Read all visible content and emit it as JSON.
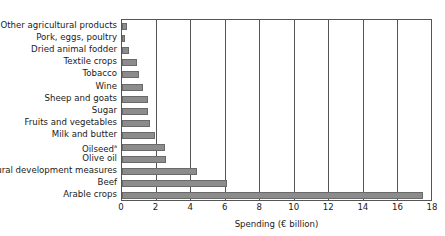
{
  "chart_data": {
    "type": "bar",
    "orientation": "horizontal",
    "title": "",
    "xlabel": "Spending (€ billion)",
    "ylabel": "",
    "xlim": [
      0,
      18
    ],
    "xticks": [
      0,
      2,
      4,
      6,
      8,
      10,
      12,
      14,
      16,
      18
    ],
    "grid": "vertical",
    "legend": null,
    "categories": [
      "Other agricultural products",
      "Pork, eggs, poultry",
      "Dried animal fodder",
      "Textile crops",
      "Tobacco",
      "Wine",
      "Sheep and goats",
      "Sugar",
      "Fruits and vegetables",
      "Milk and butter",
      "Oilseed",
      "Olive oil",
      "Rural development measures",
      "Beef",
      "Arable crops"
    ],
    "category_footnotes": {
      "Oilseed": "a"
    },
    "values": [
      0.3,
      0.15,
      0.4,
      0.85,
      1.0,
      1.2,
      1.5,
      1.5,
      1.6,
      1.9,
      2.5,
      2.55,
      4.35,
      6.05,
      17.45
    ],
    "bar_color": "#8c8c8c"
  }
}
